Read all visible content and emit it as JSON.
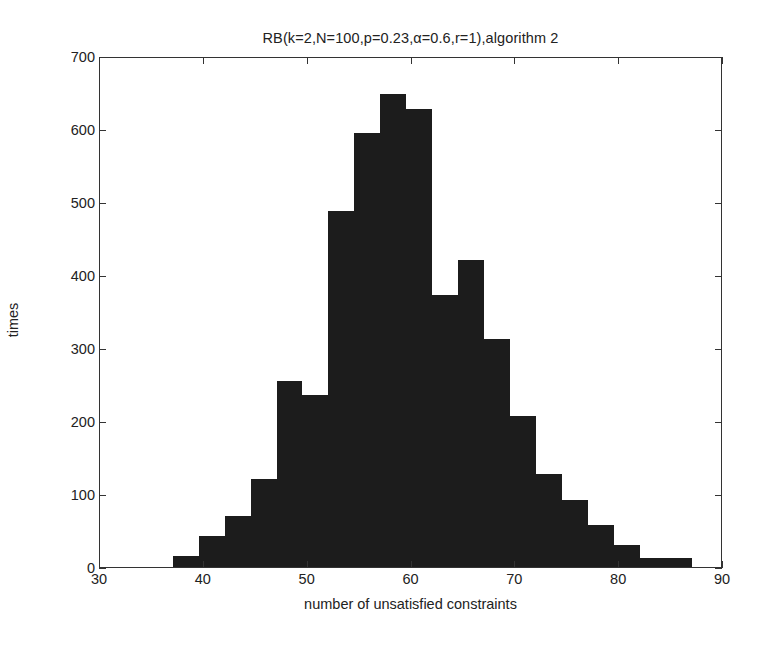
{
  "chart_data": {
    "type": "bar",
    "title": "RB(k=2,N=100,p=0.23,α=0.6,r=1),algorithm 2",
    "xlabel": "number of unsatisfied constraints",
    "ylabel": "times",
    "xlim": [
      30,
      90
    ],
    "ylim": [
      0,
      700
    ],
    "xticks": [
      30,
      40,
      50,
      60,
      70,
      80,
      90
    ],
    "yticks": [
      0,
      100,
      200,
      300,
      400,
      500,
      600,
      700
    ],
    "grid": false,
    "legend": null,
    "bin_width": 2.5,
    "bar_color": "#1c1c1c",
    "bin_edges": [
      37.0,
      39.5,
      42.0,
      44.5,
      47.0,
      49.5,
      52.0,
      54.5,
      57.0,
      59.5,
      62.0,
      64.5,
      67.0,
      69.5,
      72.0,
      74.5,
      77.0,
      79.5,
      82.0,
      84.5,
      87.0
    ],
    "categories": [
      "37.0-39.5",
      "39.5-42.0",
      "42.0-44.5",
      "44.5-47.0",
      "47.0-49.5",
      "49.5-52.0",
      "52.0-54.5",
      "54.5-57.0",
      "57.0-59.5",
      "59.5-62.0",
      "62.0-64.5",
      "64.5-67.0",
      "67.0-69.5",
      "69.5-72.0",
      "72.0-74.5",
      "74.5-77.0",
      "77.0-79.5",
      "79.5-82.0",
      "82.0-84.5",
      "84.5-87.0"
    ],
    "values": [
      15,
      42,
      70,
      120,
      255,
      235,
      488,
      595,
      648,
      627,
      372,
      420,
      312,
      207,
      128,
      92,
      57,
      30,
      12,
      12
    ]
  },
  "axes": {
    "y_tick_labels": [
      "0",
      "100",
      "200",
      "300",
      "400",
      "500",
      "600",
      "700"
    ],
    "x_tick_labels": [
      "30",
      "40",
      "50",
      "60",
      "70",
      "80",
      "90"
    ]
  }
}
